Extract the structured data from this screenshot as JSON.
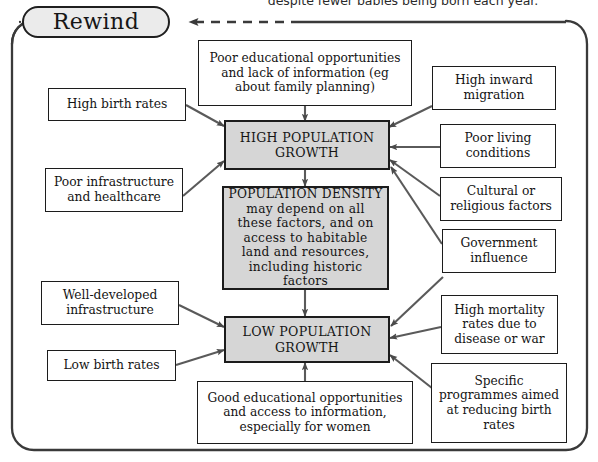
{
  "page": {
    "caption_top": "despite fewer babies being born each year.",
    "rewind_label": "Rewind"
  },
  "colors": {
    "shaded_fill": "#d6d6d6",
    "box_fill": "#ffffff",
    "stroke": "#1c1c1c",
    "pill_fill": "#ebebeb"
  },
  "diagram": {
    "type": "flowchart",
    "nodes": [
      {
        "id": "poor-education",
        "label": "Poor educational opportunities\nand lack of information (eg\nabout family planning)",
        "style": "plain"
      },
      {
        "id": "high-birth-rates",
        "label": "High birth rates",
        "style": "plain"
      },
      {
        "id": "poor-infrastructure",
        "label": "Poor infrastructure\nand healthcare",
        "style": "plain"
      },
      {
        "id": "high-inward-migration",
        "label": "High inward\nmigration",
        "style": "plain"
      },
      {
        "id": "poor-living-conditions",
        "label": "Poor living\nconditions",
        "style": "plain"
      },
      {
        "id": "cultural-religious",
        "label": "Cultural or\nreligious factors",
        "style": "plain"
      },
      {
        "id": "government-influence",
        "label": "Government\ninfluence",
        "style": "plain"
      },
      {
        "id": "high-population-growth",
        "label": "HIGH POPULATION\nGROWTH",
        "style": "shaded"
      },
      {
        "id": "population-density",
        "label": "POPULATION DENSITY\nmay depend on all\nthese factors, and on\naccess to habitable\nland and resources,\nincluding historic factors",
        "style": "shaded"
      },
      {
        "id": "low-population-growth",
        "label": "LOW POPULATION\nGROWTH",
        "style": "shaded"
      },
      {
        "id": "well-developed-infrastructure",
        "label": "Well-developed\ninfrastructure",
        "style": "plain"
      },
      {
        "id": "low-birth-rates",
        "label": "Low birth rates",
        "style": "plain"
      },
      {
        "id": "good-education",
        "label": "Good educational opportunities\nand access to information,\nespecially for women",
        "style": "plain"
      },
      {
        "id": "high-mortality",
        "label": "High mortality\nrates due to\ndisease or war",
        "style": "plain"
      },
      {
        "id": "specific-programmes",
        "label": "Specific\nprogrammes aimed\nat reducing birth\nrates",
        "style": "plain"
      }
    ],
    "edges": [
      {
        "from": "poor-education",
        "to": "high-population-growth"
      },
      {
        "from": "high-birth-rates",
        "to": "high-population-growth"
      },
      {
        "from": "poor-infrastructure",
        "to": "high-population-growth"
      },
      {
        "from": "high-inward-migration",
        "to": "high-population-growth"
      },
      {
        "from": "poor-living-conditions",
        "to": "high-population-growth"
      },
      {
        "from": "cultural-religious",
        "to": "high-population-growth"
      },
      {
        "from": "government-influence",
        "to": "high-population-growth"
      },
      {
        "from": "high-population-growth",
        "to": "population-density"
      },
      {
        "from": "population-density",
        "to": "low-population-growth"
      },
      {
        "from": "well-developed-infrastructure",
        "to": "low-population-growth"
      },
      {
        "from": "low-birth-rates",
        "to": "low-population-growth"
      },
      {
        "from": "good-education",
        "to": "low-population-growth"
      },
      {
        "from": "high-mortality",
        "to": "low-population-growth"
      },
      {
        "from": "specific-programmes",
        "to": "low-population-growth"
      },
      {
        "from": "government-influence",
        "to": "low-population-growth"
      },
      {
        "from": "frame-loop",
        "to": "rewind-pill",
        "style": "dashed"
      }
    ]
  }
}
